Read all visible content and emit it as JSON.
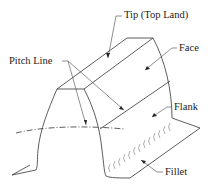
{
  "diagram": {
    "labels": {
      "tip": "Tip (Top Land)",
      "face": "Face",
      "pitch_line": "Pitch Line",
      "flank": "Flank",
      "fillet": "Fillet"
    },
    "colors": {
      "line": "#333333",
      "background": "#ffffff"
    }
  }
}
